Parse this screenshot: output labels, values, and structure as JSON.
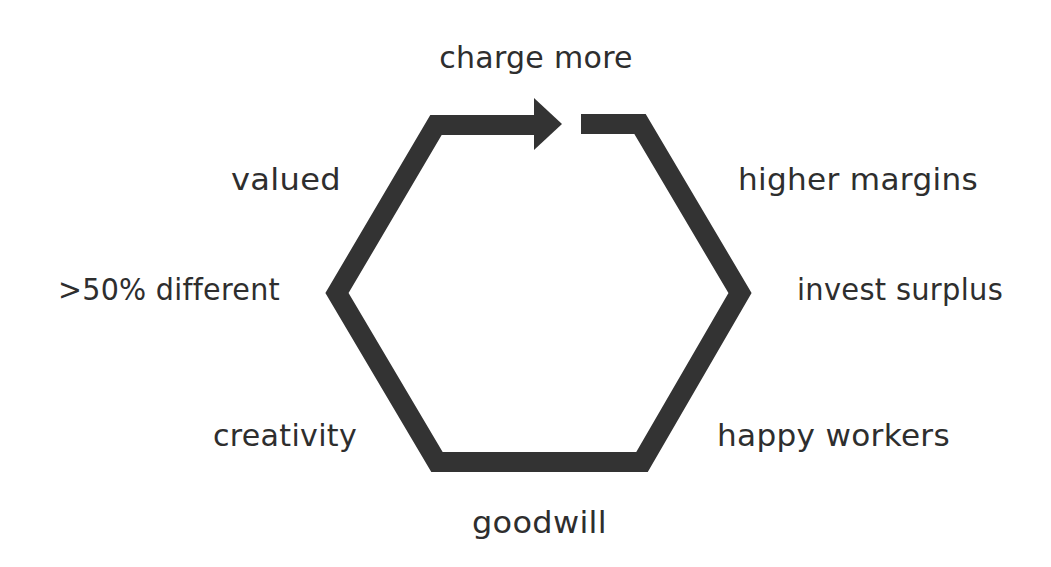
{
  "diagram": {
    "type": "cycle",
    "shape": "hexagon",
    "stroke_color": "#333333",
    "background": "#ffffff",
    "labels": {
      "top": "charge more",
      "upper_right": "higher margins",
      "right": "invest surplus",
      "lower_right": "happy workers",
      "bottom": "goodwill",
      "lower_left": "creativity",
      "left": ">50% different",
      "upper_left": "valued"
    },
    "sequence": [
      ">50% different",
      "valued",
      "charge more",
      "higher margins",
      "invest surplus",
      "happy workers",
      "goodwill",
      "creativity"
    ]
  }
}
